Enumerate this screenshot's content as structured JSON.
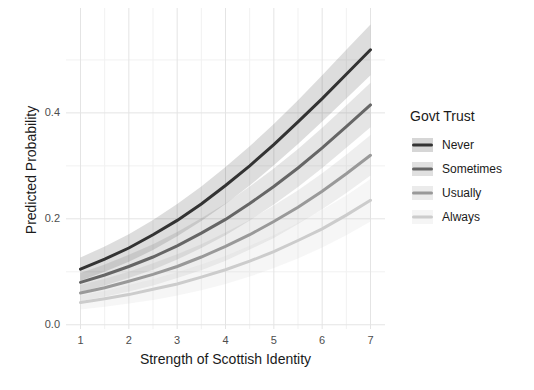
{
  "colors": {
    "background": "#ffffff",
    "grid_major": "#e4e4e4",
    "grid_minor": "#f1f1f1",
    "tick_label": "#4d4d4d",
    "axis_title": "#1a1a1a"
  },
  "chart_data": {
    "type": "line",
    "title": "",
    "xlabel": "Strength of Scottish Identity",
    "ylabel": "Predicted Probability",
    "legend_title": "Govt Trust",
    "legend_position": "right",
    "grid": "major and minor gridlines, light gray on white, no axis lines",
    "xlim": [
      0.7,
      7.3
    ],
    "ylim": [
      -0.008,
      0.598
    ],
    "xticks": [
      1,
      2,
      3,
      4,
      5,
      6,
      7
    ],
    "xticks_minor": [
      1.5,
      2.5,
      3.5,
      4.5,
      5.5,
      6.5
    ],
    "yticks": [
      {
        "v": 0.0,
        "label": "0.0"
      },
      {
        "v": 0.2,
        "label": "0.2"
      },
      {
        "v": 0.4,
        "label": "0.4"
      }
    ],
    "yticks_minor": [
      0.1,
      0.3,
      0.5
    ],
    "x": [
      1,
      1.5,
      2,
      2.5,
      3,
      3.5,
      4,
      4.5,
      5,
      5.5,
      6,
      6.5,
      7
    ],
    "ribbon_opacity": 0.17,
    "series": [
      {
        "name": "Never",
        "color": "#333333",
        "values": [
          0.105,
          0.124,
          0.145,
          0.17,
          0.197,
          0.228,
          0.263,
          0.3,
          0.34,
          0.383,
          0.427,
          0.473,
          0.519
        ],
        "ribbon_lower": [
          0.083,
          0.1,
          0.119,
          0.141,
          0.167,
          0.196,
          0.228,
          0.263,
          0.301,
          0.341,
          0.384,
          0.427,
          0.471
        ],
        "ribbon_upper": [
          0.127,
          0.148,
          0.171,
          0.198,
          0.228,
          0.261,
          0.298,
          0.337,
          0.379,
          0.424,
          0.471,
          0.519,
          0.567
        ]
      },
      {
        "name": "Sometimes",
        "color": "#666666",
        "values": [
          0.08,
          0.094,
          0.11,
          0.128,
          0.149,
          0.173,
          0.199,
          0.229,
          0.261,
          0.296,
          0.334,
          0.374,
          0.415
        ],
        "ribbon_lower": [
          0.062,
          0.074,
          0.088,
          0.104,
          0.123,
          0.145,
          0.169,
          0.197,
          0.227,
          0.26,
          0.296,
          0.334,
          0.373
        ],
        "ribbon_upper": [
          0.098,
          0.114,
          0.132,
          0.152,
          0.175,
          0.201,
          0.229,
          0.261,
          0.295,
          0.332,
          0.372,
          0.414,
          0.457
        ]
      },
      {
        "name": "Usually",
        "color": "#999999",
        "values": [
          0.06,
          0.07,
          0.082,
          0.095,
          0.11,
          0.128,
          0.148,
          0.17,
          0.195,
          0.222,
          0.252,
          0.285,
          0.32
        ],
        "ribbon_lower": [
          0.045,
          0.053,
          0.063,
          0.074,
          0.088,
          0.103,
          0.121,
          0.142,
          0.164,
          0.19,
          0.218,
          0.249,
          0.282
        ],
        "ribbon_upper": [
          0.075,
          0.087,
          0.1,
          0.116,
          0.133,
          0.152,
          0.174,
          0.198,
          0.225,
          0.254,
          0.286,
          0.321,
          0.358
        ]
      },
      {
        "name": "Always",
        "color": "#cccccc",
        "values": [
          0.042,
          0.049,
          0.057,
          0.067,
          0.077,
          0.09,
          0.104,
          0.12,
          0.138,
          0.159,
          0.181,
          0.207,
          0.235
        ],
        "ribbon_lower": [
          0.029,
          0.034,
          0.04,
          0.047,
          0.055,
          0.065,
          0.077,
          0.091,
          0.107,
          0.125,
          0.146,
          0.169,
          0.195
        ],
        "ribbon_upper": [
          0.055,
          0.064,
          0.075,
          0.086,
          0.099,
          0.114,
          0.13,
          0.149,
          0.169,
          0.192,
          0.217,
          0.244,
          0.275
        ]
      }
    ]
  }
}
